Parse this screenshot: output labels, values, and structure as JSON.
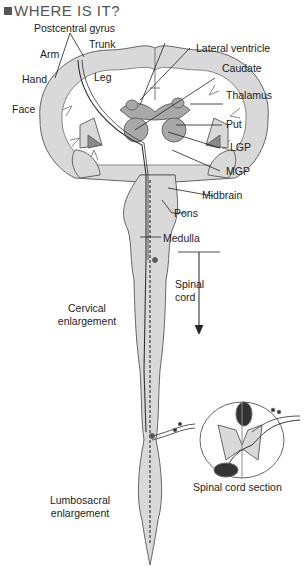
{
  "title": "WHERE IS IT?",
  "labels": {
    "postcentral_gyrus": "Postcentral gyrus",
    "trunk": "Trunk",
    "arm": "Arm",
    "leg": "Leg",
    "hand": "Hand",
    "face": "Face",
    "lateral_ventricle": "Lateral ventricle",
    "caudate": "Caudate",
    "thalamus": "Thalamus",
    "put": "Put",
    "lgp": "LGP",
    "mgp": "MGP",
    "midbrain": "Midbrain",
    "pons": "Pons",
    "medulla": "Medulla",
    "spinal_cord_line1": "Spinal",
    "spinal_cord_line2": "cord",
    "cervical_line1": "Cervical",
    "cervical_line2": "enlargement",
    "lumbosacral_line1": "Lumbosacral",
    "lumbosacral_line2": "enlargement",
    "spinal_cord_section": "Spinal cord section"
  },
  "colors": {
    "tissue_light": "#d9d9d9",
    "tissue_mid": "#a8a8a8",
    "tissue_dark": "#8a8a8a",
    "tract_dark": "#333333",
    "outline": "#555555"
  }
}
